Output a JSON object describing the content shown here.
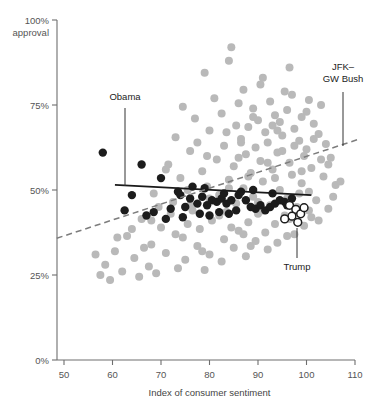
{
  "chart_data": {
    "type": "scatter",
    "title": "",
    "xlabel": "Index of consumer sentiment",
    "ylabel": "",
    "y_axis_top_label": "100%",
    "y_axis_top_sublabel": "approval",
    "xlim": [
      47,
      112
    ],
    "ylim": [
      0,
      100
    ],
    "xticks": [
      50,
      60,
      70,
      80,
      90,
      100,
      110
    ],
    "xtick_labels": [
      "50",
      "60",
      "70",
      "80",
      "90",
      "100",
      "110"
    ],
    "yticks": [
      0,
      25,
      50,
      75,
      100
    ],
    "ytick_labels": [
      "0%",
      "25%",
      "50%",
      "75%",
      "100%"
    ],
    "grid": false,
    "legend_position": "none",
    "annotations": [
      {
        "id": "obama",
        "label": "Obama",
        "text_x": 125,
        "text_y": 100,
        "line_x1": 125,
        "line_y1": 108,
        "line_x2": 125,
        "line_y2": 186
      },
      {
        "id": "jfk-gw-bush",
        "label_line1": "JFK–",
        "label_line2": "GW Bush",
        "text_x": 343,
        "text_y": 70,
        "line_x1": 343,
        "line_y1": 92,
        "line_x2": 343,
        "line_y2": 146
      },
      {
        "id": "trump",
        "label": "Trump",
        "text_x": 297,
        "text_y": 270,
        "line_x1": 297,
        "line_y1": 228,
        "line_x2": 297,
        "line_y2": 258
      }
    ],
    "series": [
      {
        "name": "Other presidents",
        "marker": "filled-circle",
        "color": "#b9b9b9",
        "radius": 4.0,
        "points": [
          [
            84.5,
            92.0
          ],
          [
            79.0,
            84.5
          ],
          [
            91.0,
            83.0
          ],
          [
            87.0,
            79.5
          ],
          [
            95.5,
            79.0
          ],
          [
            97.0,
            78.0
          ],
          [
            100.5,
            76.5
          ],
          [
            92.5,
            76.0
          ],
          [
            86.0,
            75.5
          ],
          [
            103.0,
            75.0
          ],
          [
            74.5,
            74.5
          ],
          [
            89.0,
            74.0
          ],
          [
            96.0,
            73.5
          ],
          [
            82.5,
            72.5
          ],
          [
            93.5,
            72.0
          ],
          [
            99.0,
            71.5
          ],
          [
            77.0,
            71.0
          ],
          [
            90.0,
            70.5
          ],
          [
            94.5,
            70.0
          ],
          [
            101.5,
            69.5
          ],
          [
            85.5,
            69.0
          ],
          [
            88.0,
            68.5
          ],
          [
            97.5,
            68.0
          ],
          [
            80.0,
            67.5
          ],
          [
            91.5,
            67.0
          ],
          [
            102.5,
            66.5
          ],
          [
            95.0,
            66.0
          ],
          [
            73.0,
            65.5
          ],
          [
            86.5,
            65.0
          ],
          [
            98.5,
            64.5
          ],
          [
            92.0,
            64.0
          ],
          [
            104.0,
            63.5
          ],
          [
            83.0,
            63.0
          ],
          [
            89.5,
            62.5
          ],
          [
            100.0,
            62.0
          ],
          [
            76.0,
            61.5
          ],
          [
            94.0,
            61.0
          ],
          [
            87.5,
            60.5
          ],
          [
            99.5,
            60.0
          ],
          [
            105.0,
            59.5
          ],
          [
            81.5,
            59.0
          ],
          [
            90.5,
            58.5
          ],
          [
            96.5,
            58.0
          ],
          [
            71.5,
            57.5
          ],
          [
            85.0,
            57.0
          ],
          [
            101.0,
            56.5
          ],
          [
            93.0,
            56.0
          ],
          [
            78.5,
            55.5
          ],
          [
            88.5,
            55.0
          ],
          [
            97.0,
            54.5
          ],
          [
            103.5,
            54.0
          ],
          [
            74.0,
            53.5
          ],
          [
            84.0,
            53.0
          ],
          [
            91.0,
            52.5
          ],
          [
            99.0,
            52.0
          ],
          [
            106.0,
            51.5
          ],
          [
            79.5,
            51.0
          ],
          [
            87.0,
            50.5
          ],
          [
            94.5,
            50.0
          ],
          [
            100.5,
            49.5
          ],
          [
            68.5,
            49.0
          ],
          [
            82.0,
            48.5
          ],
          [
            89.0,
            48.0
          ],
          [
            96.0,
            47.5
          ],
          [
            102.0,
            47.0
          ],
          [
            72.5,
            46.5
          ],
          [
            85.5,
            46.0
          ],
          [
            92.5,
            45.5
          ],
          [
            98.0,
            45.0
          ],
          [
            104.5,
            44.5
          ],
          [
            76.5,
            44.0
          ],
          [
            83.5,
            43.5
          ],
          [
            90.0,
            43.0
          ],
          [
            95.5,
            42.5
          ],
          [
            101.0,
            42.0
          ],
          [
            66.0,
            41.5
          ],
          [
            80.5,
            41.0
          ],
          [
            88.0,
            40.5
          ],
          [
            93.5,
            40.0
          ],
          [
            99.5,
            39.5
          ],
          [
            70.0,
            39.0
          ],
          [
            78.0,
            38.5
          ],
          [
            86.0,
            38.0
          ],
          [
            91.5,
            37.5
          ],
          [
            97.5,
            37.0
          ],
          [
            63.0,
            36.5
          ],
          [
            74.5,
            36.0
          ],
          [
            83.0,
            35.5
          ],
          [
            89.5,
            35.0
          ],
          [
            94.0,
            34.5
          ],
          [
            68.0,
            34.0
          ],
          [
            77.5,
            33.5
          ],
          [
            85.0,
            33.0
          ],
          [
            92.0,
            32.5
          ],
          [
            60.5,
            32.0
          ],
          [
            71.0,
            31.5
          ],
          [
            80.0,
            31.0
          ],
          [
            87.5,
            30.5
          ],
          [
            64.5,
            30.0
          ],
          [
            75.0,
            29.5
          ],
          [
            82.5,
            29.0
          ],
          [
            58.5,
            28.0
          ],
          [
            67.5,
            27.5
          ],
          [
            73.5,
            27.0
          ],
          [
            79.0,
            26.5
          ],
          [
            62.0,
            26.0
          ],
          [
            69.0,
            25.5
          ],
          [
            57.5,
            25.0
          ],
          [
            65.5,
            24.5
          ],
          [
            59.5,
            23.5
          ],
          [
            84.0,
            88.0
          ],
          [
            96.5,
            86.0
          ],
          [
            90.5,
            81.0
          ],
          [
            81.0,
            77.0
          ],
          [
            100.0,
            73.0
          ],
          [
            93.0,
            69.0
          ],
          [
            86.5,
            64.0
          ],
          [
            79.5,
            60.0
          ],
          [
            104.5,
            57.5
          ],
          [
            75.5,
            50.0
          ],
          [
            98.5,
            49.0
          ],
          [
            69.5,
            45.0
          ],
          [
            91.0,
            44.0
          ],
          [
            102.5,
            41.0
          ],
          [
            84.5,
            39.0
          ],
          [
            73.0,
            37.0
          ],
          [
            96.0,
            36.5
          ],
          [
            88.5,
            33.5
          ],
          [
            78.5,
            32.0
          ],
          [
            66.5,
            33.0
          ],
          [
            103.0,
            59.0
          ],
          [
            99.0,
            55.5
          ],
          [
            105.5,
            48.0
          ],
          [
            107.0,
            52.5
          ],
          [
            95.0,
            61.5
          ],
          [
            92.0,
            58.0
          ],
          [
            88.0,
            54.0
          ],
          [
            84.0,
            50.5
          ],
          [
            80.0,
            47.5
          ],
          [
            76.0,
            45.5
          ],
          [
            72.0,
            43.0
          ],
          [
            68.0,
            41.0
          ],
          [
            64.0,
            38.5
          ],
          [
            61.0,
            36.0
          ],
          [
            56.5,
            31.0
          ],
          [
            97.5,
            63.0
          ],
          [
            94.0,
            67.5
          ],
          [
            101.5,
            65.0
          ],
          [
            89.0,
            71.5
          ],
          [
            83.5,
            67.0
          ],
          [
            77.5,
            64.0
          ],
          [
            71.0,
            56.0
          ],
          [
            86.0,
            59.5
          ],
          [
            93.5,
            53.5
          ],
          [
            90.0,
            46.5
          ],
          [
            82.0,
            42.5
          ],
          [
            75.5,
            40.0
          ],
          [
            100.5,
            44.0
          ],
          [
            96.5,
            41.5
          ],
          [
            87.0,
            37.0
          ]
        ]
      },
      {
        "name": "Obama",
        "marker": "filled-circle",
        "color": "#1c1c1c",
        "radius": 4.2,
        "points": [
          [
            58.0,
            61.0
          ],
          [
            66.0,
            57.5
          ],
          [
            70.0,
            53.5
          ],
          [
            64.0,
            48.5
          ],
          [
            73.5,
            49.5
          ],
          [
            76.0,
            47.5
          ],
          [
            78.5,
            48.0
          ],
          [
            80.5,
            47.0
          ],
          [
            81.5,
            46.5
          ],
          [
            82.5,
            47.5
          ],
          [
            83.5,
            46.0
          ],
          [
            84.5,
            47.0
          ],
          [
            79.5,
            45.5
          ],
          [
            77.5,
            46.0
          ],
          [
            75.0,
            45.0
          ],
          [
            72.0,
            44.5
          ],
          [
            68.5,
            43.5
          ],
          [
            86.0,
            48.5
          ],
          [
            87.5,
            47.0
          ],
          [
            88.5,
            45.0
          ],
          [
            89.5,
            44.5
          ],
          [
            90.5,
            45.5
          ],
          [
            91.5,
            44.0
          ],
          [
            92.5,
            45.0
          ],
          [
            93.5,
            46.0
          ],
          [
            94.5,
            47.0
          ],
          [
            95.5,
            46.5
          ],
          [
            96.0,
            45.5
          ],
          [
            85.5,
            44.0
          ],
          [
            84.0,
            43.0
          ],
          [
            82.0,
            43.5
          ],
          [
            80.0,
            42.5
          ],
          [
            78.0,
            43.0
          ],
          [
            74.5,
            42.0
          ],
          [
            71.0,
            41.5
          ],
          [
            67.0,
            42.5
          ],
          [
            62.5,
            44.0
          ],
          [
            97.0,
            47.5
          ],
          [
            93.0,
            49.0
          ],
          [
            89.0,
            50.0
          ],
          [
            86.5,
            49.5
          ],
          [
            83.0,
            49.0
          ],
          [
            79.0,
            50.5
          ],
          [
            76.5,
            51.0
          ],
          [
            74.0,
            48.5
          ]
        ]
      },
      {
        "name": "Trump",
        "marker": "open-circle",
        "color": "#1c1c1c",
        "radius": 3.9,
        "points": [
          [
            96.5,
            45.5
          ],
          [
            97.8,
            44.3
          ],
          [
            98.8,
            43.0
          ],
          [
            97.0,
            42.3
          ],
          [
            95.5,
            41.5
          ],
          [
            98.2,
            40.5
          ],
          [
            99.5,
            44.8
          ]
        ]
      }
    ],
    "trend_lines": [
      {
        "name": "Obama trend",
        "style": "solid",
        "color": "#1a1a1a",
        "x1": 60.5,
        "y1": 51.5,
        "x2": 101.0,
        "y2": 48.5
      },
      {
        "name": "Historical trend",
        "style": "dashed",
        "color": "#7d7d7d",
        "x1": 48.5,
        "y1": 35.8,
        "x2": 110.5,
        "y2": 64.8
      }
    ]
  }
}
